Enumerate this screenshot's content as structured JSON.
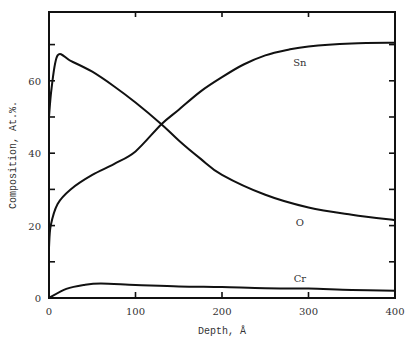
{
  "chart_data": {
    "type": "line",
    "title": "",
    "xlabel": "Depth, Å",
    "ylabel": "Composition, At.%.",
    "xlim": [
      0,
      400
    ],
    "ylim": [
      0,
      79
    ],
    "x_ticks": [
      0,
      100,
      200,
      300,
      400
    ],
    "x_tick_labels": [
      "0",
      "100",
      "200",
      "300",
      "400"
    ],
    "y_ticks": [
      0,
      10,
      20,
      30,
      40,
      50,
      60,
      70
    ],
    "y_tick_labels": [
      "0",
      "20",
      "40",
      "60"
    ],
    "y_labeled_ticks": [
      0,
      20,
      40,
      60
    ],
    "grid": false,
    "legend": "inline labels",
    "series": [
      {
        "name": "Sn",
        "label_pos": [
          290,
          64
        ],
        "x": [
          0,
          2,
          10,
          25,
          50,
          75,
          100,
          130,
          150,
          175,
          200,
          225,
          250,
          275,
          300,
          350,
          400
        ],
        "values": [
          14,
          20,
          26,
          30,
          34,
          37,
          40.5,
          48,
          52,
          57,
          61,
          64.5,
          67,
          68.5,
          69.5,
          70.3,
          70.5
        ]
      },
      {
        "name": "O",
        "label_pos": [
          290,
          20
        ],
        "x": [
          0,
          3,
          10,
          25,
          50,
          75,
          100,
          130,
          150,
          175,
          200,
          250,
          300,
          350,
          400
        ],
        "values": [
          50,
          58,
          67,
          65.5,
          62.5,
          58.5,
          54,
          48,
          43.5,
          38.5,
          34,
          28.5,
          25,
          23,
          21.5
        ]
      },
      {
        "name": "Cr",
        "label_pos": [
          290,
          4.5
        ],
        "x": [
          0,
          20,
          40,
          60,
          100,
          150,
          200,
          250,
          300,
          350,
          400
        ],
        "values": [
          0,
          2.5,
          3.6,
          4,
          3.6,
          3.2,
          3,
          2.7,
          2.6,
          2.2,
          2
        ]
      }
    ]
  },
  "labels": {
    "xlabel": "Depth, Å",
    "ylabel": "Composition, At.%."
  }
}
